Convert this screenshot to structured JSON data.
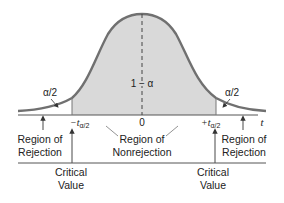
{
  "diagram": {
    "type": "two-tailed t distribution rejection regions",
    "colors": {
      "curve": "#707070",
      "fill": "#d9d9d9",
      "axis": "#555555",
      "text": "#222222",
      "background": "#ffffff"
    },
    "labels": {
      "center_area": "1 − α",
      "left_tail_area": "α/2",
      "right_tail_area": "α/2",
      "axis_variable": "t",
      "zero_tick": "0",
      "left_critical_prefix": "−t",
      "right_critical_prefix": "+t",
      "critical_subscript": "α/2",
      "left_region_line1": "Region of",
      "left_region_line2": "Rejection",
      "center_region_line1": "Region of",
      "center_region_line2": "Nonrejection",
      "right_region_line1": "Region of",
      "right_region_line2": "Rejection",
      "left_critical_line1": "Critical",
      "left_critical_line2": "Value",
      "right_critical_line1": "Critical",
      "right_critical_line2": "Value"
    }
  }
}
